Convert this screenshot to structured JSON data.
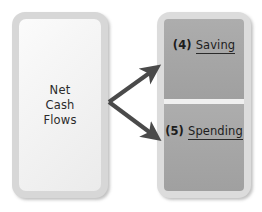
{
  "diagram": {
    "colors": {
      "box_border": "#d7d7d7",
      "left_fill": "#f4f4f4",
      "segment_fill": "#a6a6a6",
      "divider": "#f0f0f0",
      "arrow": "#4a4a4a",
      "text": "#1d1d1d"
    },
    "source_box": {
      "label": "Net\nCash\nFlows"
    },
    "target_box": {
      "segments": [
        {
          "number": "(4)",
          "label": "Saving"
        },
        {
          "number": "(5)",
          "label": "Spending"
        }
      ]
    },
    "connectors": [
      {
        "name": "arrow-to-saving",
        "from": "Net Cash Flows",
        "to": "(4) Saving"
      },
      {
        "name": "arrow-to-spending",
        "from": "Net Cash Flows",
        "to": "(5) Spending"
      }
    ]
  }
}
